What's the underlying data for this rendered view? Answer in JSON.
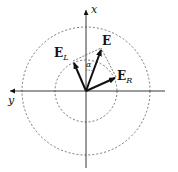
{
  "diagram": {
    "axes": {
      "x_label": "x",
      "y_label": "y"
    },
    "vectors": [
      {
        "id": "E_L",
        "label": "E",
        "subscript": "L"
      },
      {
        "id": "E",
        "label": "E",
        "subscript": ""
      },
      {
        "id": "E_R",
        "label": "E",
        "subscript": "R"
      }
    ],
    "angle_label": "α",
    "circles": [
      "inner-dashed-circle",
      "outer-dashed-circle"
    ],
    "colors": {
      "ink": "#111111",
      "dashed": "#555555"
    }
  }
}
